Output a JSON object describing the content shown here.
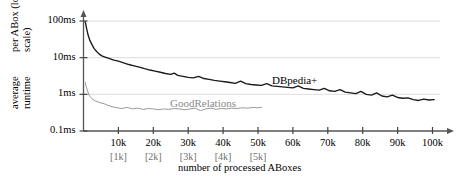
{
  "chart_data": {
    "type": "line",
    "title": "",
    "xlabel": "number of processed ABoxes",
    "ylabel_line1": "average runtime",
    "ylabel_line2": "per ABox (log. scale)",
    "yscale": "log",
    "ylim": [
      0.1,
      100
    ],
    "xlim": [
      0,
      104000
    ],
    "grid": true,
    "grid_axis": "y",
    "legend_position": "inline-annotation",
    "yticks": [
      100,
      10,
      1,
      0.1
    ],
    "ytick_labels": [
      "100ms",
      "10ms",
      "1ms",
      "0.1ms"
    ],
    "xticks": [
      10000,
      20000,
      30000,
      40000,
      50000,
      60000,
      70000,
      80000,
      90000,
      100000
    ],
    "xtick_labels": [
      "10k",
      "20k",
      "30k",
      "40k",
      "50k",
      "60k",
      "70k",
      "80k",
      "90k",
      "100k"
    ],
    "xtick_sub_labels": [
      "[1k]",
      "[2k]",
      "[3k]",
      "[4k]",
      "[5k]"
    ],
    "series": [
      {
        "name": "DBpedia+",
        "color": "#1a1a1a",
        "x": [
          500,
          900,
          1300,
          1800,
          2400,
          3000,
          3700,
          4500,
          5400,
          6400,
          7500,
          8700,
          10000,
          11500,
          13000,
          14500,
          16000,
          17500,
          19000,
          20500,
          22000,
          23500,
          25000,
          26000,
          27000,
          28500,
          30000,
          31500,
          33000,
          34500,
          36000,
          37500,
          39000,
          40500,
          42000,
          43500,
          45000,
          46500,
          48000,
          49500,
          51000,
          52500,
          54000,
          55500,
          57000,
          58500,
          60000,
          61500,
          63000,
          64500,
          66000,
          67500,
          69000,
          70500,
          72000,
          73500,
          75000,
          76500,
          78000,
          79500,
          81000,
          82500,
          84000,
          85500,
          87000,
          88500,
          90000,
          91500,
          93000,
          94500,
          96000,
          97500,
          99000,
          100500
        ],
        "y": [
          95,
          62,
          42,
          30,
          23,
          18,
          15,
          12.5,
          11,
          10.2,
          9.4,
          8.6,
          8.0,
          7.2,
          6.5,
          6.0,
          5.5,
          5.0,
          4.6,
          4.3,
          4.0,
          3.7,
          3.5,
          3.8,
          3.3,
          3.1,
          2.9,
          2.8,
          3.1,
          2.7,
          2.55,
          2.4,
          2.3,
          2.2,
          2.1,
          2.0,
          2.3,
          1.95,
          1.85,
          1.8,
          1.75,
          1.95,
          1.7,
          1.65,
          1.6,
          1.55,
          1.5,
          1.7,
          1.45,
          1.4,
          1.35,
          1.3,
          1.45,
          1.25,
          1.2,
          1.35,
          1.15,
          1.1,
          1.05,
          1.2,
          1.0,
          0.95,
          1.1,
          0.9,
          0.85,
          0.95,
          0.82,
          0.78,
          0.8,
          0.72,
          0.68,
          0.74,
          0.7,
          0.72
        ],
        "label_x": 52000,
        "label_y": 2.6
      },
      {
        "name": "GoodRelations",
        "color": "#9a9a9a",
        "x": [
          500,
          800,
          1200,
          1600,
          2100,
          2700,
          3400,
          4200,
          5000,
          6000,
          7000,
          8200,
          9500,
          11000,
          12500,
          14000,
          15500,
          17000,
          18500,
          20000,
          21500,
          23000,
          24500,
          26000,
          27500,
          29000,
          30500,
          32000,
          33500,
          35000,
          36500,
          38000,
          39500,
          41000,
          42500,
          44000,
          45500,
          47000,
          48500,
          50000,
          51000
        ],
        "y": [
          2.1,
          1.6,
          1.2,
          0.95,
          0.82,
          0.72,
          0.66,
          0.62,
          0.58,
          0.55,
          0.5,
          0.46,
          0.43,
          0.41,
          0.44,
          0.4,
          0.42,
          0.39,
          0.41,
          0.4,
          0.38,
          0.4,
          0.39,
          0.41,
          0.4,
          0.38,
          0.4,
          0.42,
          0.36,
          0.4,
          0.42,
          0.39,
          0.41,
          0.4,
          0.42,
          0.41,
          0.43,
          0.42,
          0.44,
          0.43,
          0.44
        ],
        "label_x": 25000,
        "label_y": 0.95
      }
    ]
  },
  "axes": {
    "x_title": "number of processed ABoxes",
    "y_title_line1": "average runtime",
    "y_title_line2": "per ABox (log. scale)"
  },
  "annotations": {
    "dbpedia_label": "DBpedia+",
    "goodrelations_label": "GoodRelations"
  }
}
